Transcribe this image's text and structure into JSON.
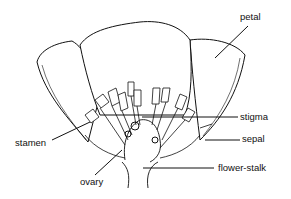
{
  "diagram": {
    "labels": {
      "petal": "petal",
      "stigma": "stigma",
      "stamen": "stamen",
      "sepal": "sepal",
      "ovary": "ovary",
      "flower_stalk": "flower-stalk"
    },
    "colors": {
      "line": "#111111",
      "background": "#ffffff"
    }
  }
}
